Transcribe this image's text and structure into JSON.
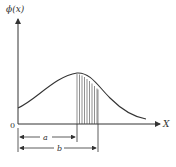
{
  "diagram": {
    "y_axis_label": "ϕ(x)",
    "x_axis_label": "X",
    "origin_label": "0",
    "dimension_a_label": "a",
    "dimension_b_label": "b",
    "shaded_region": "area under curve between a and b",
    "colors": {
      "line": "#333333",
      "background": "#ffffff"
    }
  }
}
